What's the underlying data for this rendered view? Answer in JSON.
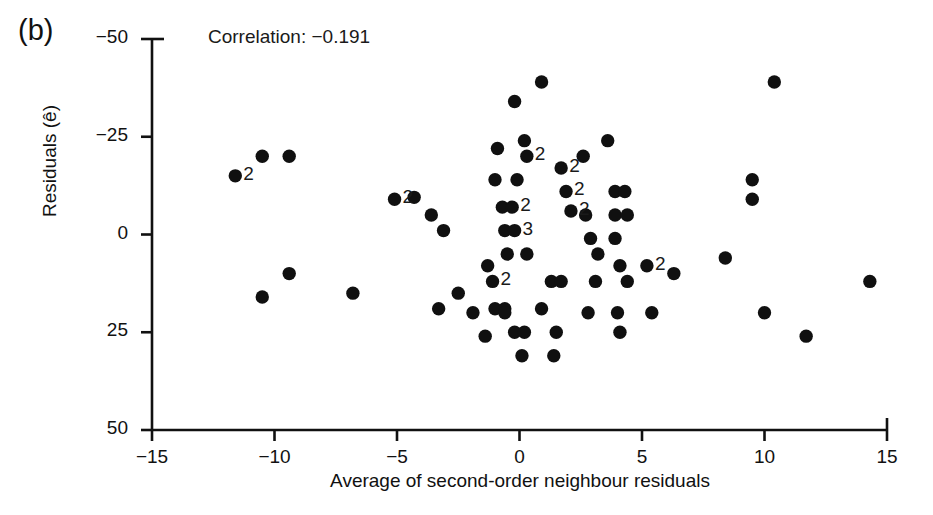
{
  "panel": {
    "label": "(b)"
  },
  "annotation": {
    "correlation_text": "Correlation: −0.191"
  },
  "axes": {
    "xlabel": "Average of second-order neighbour residuals",
    "ylabel": "Residuals (ê)",
    "xticks": [
      "−15",
      "−10",
      "−5",
      "0",
      "5",
      "10",
      "15"
    ],
    "yticks": [
      "50",
      "25",
      "0",
      "−25",
      "−50"
    ]
  },
  "chart_data": {
    "type": "scatter",
    "title": "(b)",
    "xlabel": "Average of second-order neighbour residuals",
    "ylabel": "Residuals (ê)",
    "xlim": [
      -15,
      15
    ],
    "ylim": [
      -50,
      50
    ],
    "xticks": [
      -15,
      -10,
      -5,
      0,
      5,
      10,
      15
    ],
    "yticks": [
      -50,
      -25,
      0,
      25,
      50
    ],
    "grid": false,
    "legend": null,
    "correlation": -0.191,
    "marker": {
      "shape": "circle",
      "color": "#101010",
      "size": 7
    },
    "note": "Numeric labels next to some markers give the number of coincident observations at that location.",
    "points": [
      {
        "x": -11.6,
        "y": 15,
        "count": 2,
        "label": "2"
      },
      {
        "x": -10.5,
        "y": 20,
        "count": 1
      },
      {
        "x": -9.4,
        "y": 20,
        "count": 1
      },
      {
        "x": -10.5,
        "y": -16,
        "count": 1
      },
      {
        "x": -9.4,
        "y": -10,
        "count": 1
      },
      {
        "x": -6.8,
        "y": -15,
        "count": 1
      },
      {
        "x": -5.1,
        "y": 9,
        "count": 2,
        "label": "2"
      },
      {
        "x": -4.3,
        "y": 9.5,
        "count": 1
      },
      {
        "x": -3.6,
        "y": 5,
        "count": 1
      },
      {
        "x": -3.1,
        "y": 1,
        "count": 1
      },
      {
        "x": -3.3,
        "y": -19,
        "count": 1
      },
      {
        "x": -2.5,
        "y": -15,
        "count": 1
      },
      {
        "x": -1.9,
        "y": -20,
        "count": 1
      },
      {
        "x": -1.3,
        "y": -8,
        "count": 1
      },
      {
        "x": -1.1,
        "y": -12,
        "count": 2,
        "label": "2"
      },
      {
        "x": -1.0,
        "y": -19,
        "count": 1
      },
      {
        "x": -0.6,
        "y": -19,
        "count": 1
      },
      {
        "x": -1.4,
        "y": -26,
        "count": 1
      },
      {
        "x": -0.9,
        "y": 22,
        "count": 1
      },
      {
        "x": -1.0,
        "y": 14,
        "count": 1
      },
      {
        "x": -0.2,
        "y": 34,
        "count": 1
      },
      {
        "x": -0.1,
        "y": 14,
        "count": 1
      },
      {
        "x": 0.2,
        "y": 24,
        "count": 1
      },
      {
        "x": 0.3,
        "y": 20,
        "count": 2,
        "label": "2"
      },
      {
        "x": -0.7,
        "y": 7,
        "count": 1
      },
      {
        "x": -0.3,
        "y": 7,
        "count": 2,
        "label": "2"
      },
      {
        "x": -0.6,
        "y": 1,
        "count": 1
      },
      {
        "x": -0.2,
        "y": 1,
        "count": 3,
        "label": "3"
      },
      {
        "x": -0.5,
        "y": -5,
        "count": 1
      },
      {
        "x": 0.3,
        "y": -5,
        "count": 1
      },
      {
        "x": -0.6,
        "y": -20,
        "count": 1
      },
      {
        "x": -0.2,
        "y": -25,
        "count": 1
      },
      {
        "x": 0.2,
        "y": -25,
        "count": 1
      },
      {
        "x": 0.1,
        "y": -31,
        "count": 1
      },
      {
        "x": 0.9,
        "y": 39,
        "count": 1
      },
      {
        "x": 1.3,
        "y": -12,
        "count": 1
      },
      {
        "x": 1.7,
        "y": -12,
        "count": 1
      },
      {
        "x": 0.9,
        "y": -19,
        "count": 1
      },
      {
        "x": 1.5,
        "y": -25,
        "count": 1
      },
      {
        "x": 1.7,
        "y": 17,
        "count": 2,
        "label": "2"
      },
      {
        "x": 1.9,
        "y": 11,
        "count": 2,
        "label": "2"
      },
      {
        "x": 2.1,
        "y": 6,
        "count": 2,
        "label": "2"
      },
      {
        "x": 1.4,
        "y": -31,
        "count": 1
      },
      {
        "x": 2.6,
        "y": 20,
        "count": 1
      },
      {
        "x": 2.7,
        "y": 5,
        "count": 1
      },
      {
        "x": 2.9,
        "y": -1,
        "count": 1
      },
      {
        "x": 3.2,
        "y": -5,
        "count": 1
      },
      {
        "x": 3.1,
        "y": -12,
        "count": 1
      },
      {
        "x": 2.8,
        "y": -20,
        "count": 1
      },
      {
        "x": 3.6,
        "y": 24,
        "count": 1
      },
      {
        "x": 3.9,
        "y": 11,
        "count": 1
      },
      {
        "x": 4.3,
        "y": 11,
        "count": 1
      },
      {
        "x": 3.9,
        "y": 5,
        "count": 1
      },
      {
        "x": 4.4,
        "y": 5,
        "count": 1
      },
      {
        "x": 3.9,
        "y": -1,
        "count": 1
      },
      {
        "x": 4.1,
        "y": -8,
        "count": 1
      },
      {
        "x": 4.4,
        "y": -12,
        "count": 1
      },
      {
        "x": 4.0,
        "y": -20,
        "count": 1
      },
      {
        "x": 4.1,
        "y": -25,
        "count": 1
      },
      {
        "x": 5.2,
        "y": -8,
        "count": 2,
        "label": "2"
      },
      {
        "x": 5.4,
        "y": -20,
        "count": 1
      },
      {
        "x": 6.3,
        "y": -10,
        "count": 1
      },
      {
        "x": 8.4,
        "y": -6,
        "count": 1
      },
      {
        "x": 9.5,
        "y": 14,
        "count": 1
      },
      {
        "x": 9.5,
        "y": 9,
        "count": 1
      },
      {
        "x": 10.4,
        "y": 39,
        "count": 1
      },
      {
        "x": 10.0,
        "y": -20,
        "count": 1
      },
      {
        "x": 11.7,
        "y": -26,
        "count": 1
      },
      {
        "x": 14.3,
        "y": -12,
        "count": 1
      }
    ]
  }
}
